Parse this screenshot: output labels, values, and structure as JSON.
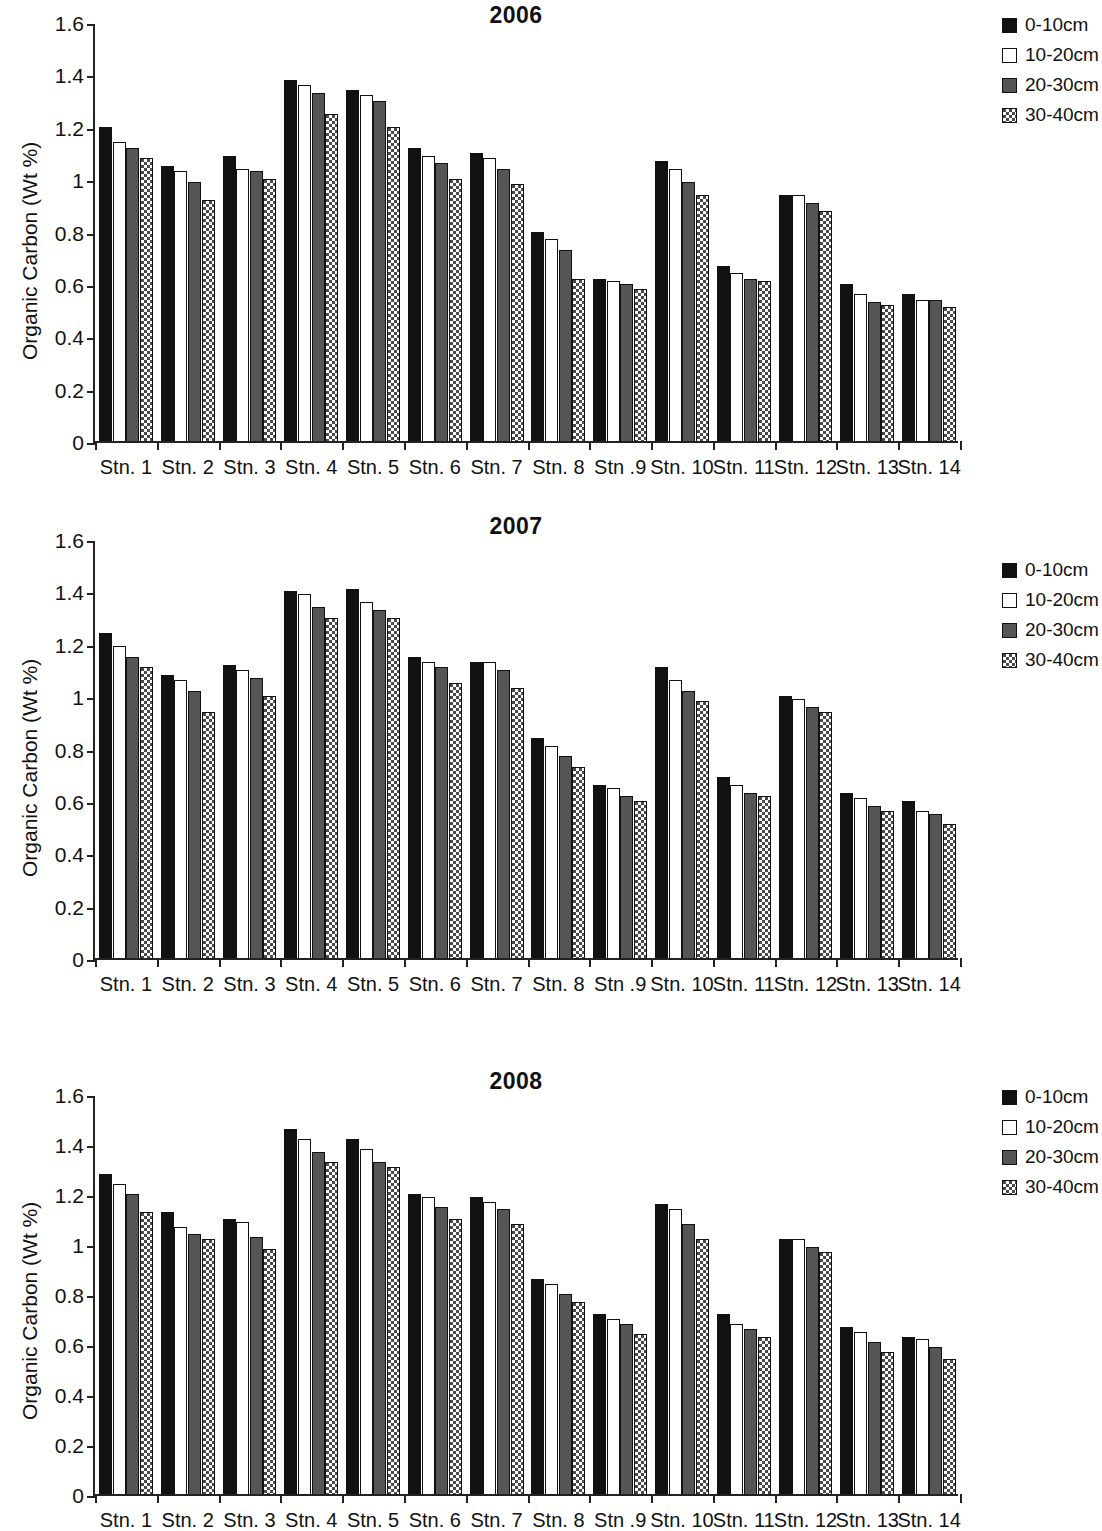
{
  "figure": {
    "y_axis_label": "Organic Carbon (Wt %)",
    "y_ticks": [
      "0",
      "0.2",
      "0.4",
      "0.6",
      "0.8",
      "1",
      "1.2",
      "1.4",
      "1.6"
    ],
    "series_colors": {
      "0-10cm": "#111111",
      "10-20cm": "#ffffff",
      "20-30cm": "#555555",
      "30-40cm": "#4a4a4a"
    }
  },
  "legend": [
    {
      "label": "0-10cm",
      "pattern": "solid-black"
    },
    {
      "label": "10-20cm",
      "pattern": "solid-white"
    },
    {
      "label": "20-30cm",
      "pattern": "solid-gray"
    },
    {
      "label": "30-40cm",
      "pattern": "checkered"
    }
  ],
  "chart_data": [
    {
      "type": "bar",
      "title": "2006",
      "xlabel": "",
      "ylabel": "Organic Carbon (Wt %)",
      "ylim": [
        0,
        1.6
      ],
      "ytick_step": 0.2,
      "grid": false,
      "legend_position": "top-right",
      "categories": [
        "Stn. 1",
        "Stn. 2",
        "Stn. 3",
        "Stn. 4",
        "Stn. 5",
        "Stn. 6",
        "Stn. 7",
        "Stn. 8",
        "Stn .9",
        "Stn. 10",
        "Stn. 11",
        "Stn. 12",
        "Stn. 13",
        "Stn. 14"
      ],
      "series": [
        {
          "name": "0-10cm",
          "values": [
            1.2,
            1.05,
            1.09,
            1.38,
            1.34,
            1.12,
            1.1,
            0.8,
            0.62,
            1.07,
            0.67,
            0.94,
            0.6,
            0.56
          ]
        },
        {
          "name": "10-20cm",
          "values": [
            1.14,
            1.03,
            1.04,
            1.36,
            1.32,
            1.09,
            1.08,
            0.77,
            0.61,
            1.04,
            0.64,
            0.94,
            0.56,
            0.54
          ]
        },
        {
          "name": "20-30cm",
          "values": [
            1.12,
            0.99,
            1.03,
            1.33,
            1.3,
            1.06,
            1.04,
            0.73,
            0.6,
            0.99,
            0.62,
            0.91,
            0.53,
            0.54
          ]
        },
        {
          "name": "30-40cm",
          "values": [
            1.08,
            0.92,
            1.0,
            1.25,
            1.2,
            1.0,
            0.98,
            0.62,
            0.58,
            0.94,
            0.61,
            0.88,
            0.52,
            0.51
          ]
        }
      ]
    },
    {
      "type": "bar",
      "title": "2007",
      "xlabel": "",
      "ylabel": "Organic Carbon (Wt %)",
      "ylim": [
        0,
        1.6
      ],
      "ytick_step": 0.2,
      "grid": false,
      "legend_position": "top-right",
      "categories": [
        "Stn. 1",
        "Stn. 2",
        "Stn. 3",
        "Stn. 4",
        "Stn. 5",
        "Stn. 6",
        "Stn. 7",
        "Stn. 8",
        "Stn .9",
        "Stn. 10",
        "Stn. 11",
        "Stn. 12",
        "Stn. 13",
        "Stn. 14"
      ],
      "series": [
        {
          "name": "0-10cm",
          "values": [
            1.24,
            1.08,
            1.12,
            1.4,
            1.41,
            1.15,
            1.13,
            0.84,
            0.66,
            1.11,
            0.69,
            1.0,
            0.63,
            0.6
          ]
        },
        {
          "name": "10-20cm",
          "values": [
            1.19,
            1.06,
            1.1,
            1.39,
            1.36,
            1.13,
            1.13,
            0.81,
            0.65,
            1.06,
            0.66,
            0.99,
            0.61,
            0.56
          ]
        },
        {
          "name": "20-30cm",
          "values": [
            1.15,
            1.02,
            1.07,
            1.34,
            1.33,
            1.11,
            1.1,
            0.77,
            0.62,
            1.02,
            0.63,
            0.96,
            0.58,
            0.55
          ]
        },
        {
          "name": "30-40cm",
          "values": [
            1.11,
            0.94,
            1.0,
            1.3,
            1.3,
            1.05,
            1.03,
            0.73,
            0.6,
            0.98,
            0.62,
            0.94,
            0.56,
            0.51
          ]
        }
      ]
    },
    {
      "type": "bar",
      "title": "2008",
      "xlabel": "",
      "ylabel": "Organic Carbon (Wt %)",
      "ylim": [
        0,
        1.6
      ],
      "ytick_step": 0.2,
      "grid": false,
      "legend_position": "top-right",
      "categories": [
        "Stn. 1",
        "Stn. 2",
        "Stn. 3",
        "Stn. 4",
        "Stn. 5",
        "Stn. 6",
        "Stn. 7",
        "Stn. 8",
        "Stn .9",
        "Stn. 10",
        "Stn. 11",
        "Stn. 12",
        "Stn. 13",
        "Stn. 14"
      ],
      "series": [
        {
          "name": "0-10cm",
          "values": [
            1.28,
            1.13,
            1.1,
            1.46,
            1.42,
            1.2,
            1.19,
            0.86,
            0.72,
            1.16,
            0.72,
            1.02,
            0.67,
            0.63
          ]
        },
        {
          "name": "10-20cm",
          "values": [
            1.24,
            1.07,
            1.09,
            1.42,
            1.38,
            1.19,
            1.17,
            0.84,
            0.7,
            1.14,
            0.68,
            1.02,
            0.65,
            0.62
          ]
        },
        {
          "name": "20-30cm",
          "values": [
            1.2,
            1.04,
            1.03,
            1.37,
            1.33,
            1.15,
            1.14,
            0.8,
            0.68,
            1.08,
            0.66,
            0.99,
            0.61,
            0.59
          ]
        },
        {
          "name": "30-40cm",
          "values": [
            1.13,
            1.02,
            0.98,
            1.33,
            1.31,
            1.1,
            1.08,
            0.77,
            0.64,
            1.02,
            0.63,
            0.97,
            0.57,
            0.54
          ]
        }
      ]
    }
  ]
}
